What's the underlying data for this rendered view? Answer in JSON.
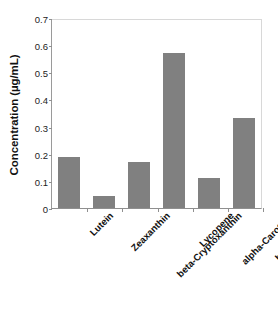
{
  "chart_data": {
    "type": "bar",
    "title": "",
    "xlabel": "",
    "ylabel": "Concentration (µg/mL)",
    "categories": [
      "Lutein",
      "Zeaxanthin",
      "beta-Cryptoxanthin",
      "Lycopene",
      "alpha-Carotene",
      "beta-Carotene"
    ],
    "values": [
      0.19,
      0.045,
      0.17,
      0.578,
      0.11,
      0.337
    ],
    "ylim": [
      0,
      0.7
    ],
    "ytick_labels": [
      "0",
      "0.1",
      "0.2",
      "0.3",
      "0.4",
      "0.5",
      "0.6",
      "0.7"
    ],
    "ytick_values": [
      0,
      0.1,
      0.2,
      0.3,
      0.4,
      0.5,
      0.6,
      0.7
    ],
    "grid": false,
    "legend": false,
    "legend_position": "none",
    "bar_color": "#808080",
    "axis_color": "#8f8f8f",
    "background_color": "#ffffff",
    "label_rotation_degrees": -45
  }
}
